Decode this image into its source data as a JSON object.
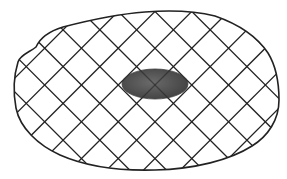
{
  "diagram": {
    "type": "crosshatched-region-with-inclusion",
    "canvas": {
      "width": 287,
      "height": 179,
      "background": "#ffffff"
    },
    "outline": {
      "shape": "irregular-oval",
      "stroke": "#222222",
      "stroke_width": 1.6,
      "path": "M 36 47 C 30 52, 20 55, 18 62 C 14 75, 13 92, 16 108 C 20 128, 38 145, 60 155 C 85 166, 120 171, 155 170 C 195 169, 230 160, 252 146 C 268 136, 279 120, 279 100 C 279 80, 276 66, 268 53 C 256 35, 238 24, 215 16 C 195 11, 170 10, 145 12 C 118 14, 90 20, 63 27 C 50 31, 40 38, 36 47 Z"
    },
    "hatch": {
      "pattern": "diagonal-crosshatch",
      "angles_deg": [
        45,
        -45
      ],
      "spacing_px": 26,
      "origin": [
        155,
        85
      ],
      "stroke": "#222222",
      "stroke_width": 1.3
    },
    "inclusion": {
      "shape": "rounded-ellipse",
      "center": [
        155,
        84
      ],
      "rx": 33,
      "ry": 15,
      "fill": "#555555",
      "edge": "#3c3c3c"
    }
  }
}
